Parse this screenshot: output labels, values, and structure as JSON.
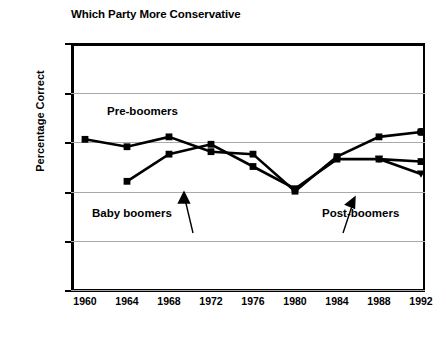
{
  "chart_data": {
    "type": "line",
    "title": "Which Party More Conservative",
    "xlabel": "",
    "ylabel": "Percentage Correct",
    "x": [
      1960,
      1964,
      1968,
      1972,
      1976,
      1980,
      1984,
      1988,
      1992
    ],
    "xtick_labels": [
      "1960",
      "1964",
      "1968",
      "1972",
      "1976",
      "1980",
      "1984",
      "1988",
      "1992"
    ],
    "ytick_labels": [
      "0",
      "20",
      "40",
      "60",
      "80",
      "100"
    ],
    "yticks": [
      0,
      20,
      40,
      60,
      80,
      100
    ],
    "ylim": [
      0,
      100
    ],
    "xlim": [
      1958,
      1994
    ],
    "grid": "horizontal",
    "legend": "annotations-inline",
    "series": [
      {
        "name": "Pre-boomers",
        "marker": "square",
        "x": [
          1960,
          1964,
          1968,
          1972,
          1976,
          1980,
          1984,
          1988,
          1992
        ],
        "values": [
          61,
          58,
          62,
          56,
          55,
          40,
          54,
          62,
          64
        ]
      },
      {
        "name": "Baby boomers",
        "marker": "square",
        "x": [
          1964,
          1968,
          1972,
          1976,
          1980,
          1984,
          1988,
          1992
        ],
        "values": [
          44,
          55,
          59,
          50,
          41,
          53,
          53,
          52
        ]
      },
      {
        "name": "Post-boomers",
        "marker": "triangle",
        "x": [
          1988,
          1992
        ],
        "values": [
          53,
          47
        ]
      }
    ],
    "annotations": [
      {
        "label": "Pre-boomers",
        "target_series": "Pre-boomers"
      },
      {
        "label": "Baby boomers",
        "target_series": "Baby boomers",
        "arrow": true
      },
      {
        "label": "Post-boomers",
        "target_series": "Post-boomers",
        "arrow": true
      }
    ],
    "colors": {
      "line": "#000000",
      "grid": "#a9a9a9",
      "axis": "#000000",
      "background": "#ffffff"
    }
  }
}
